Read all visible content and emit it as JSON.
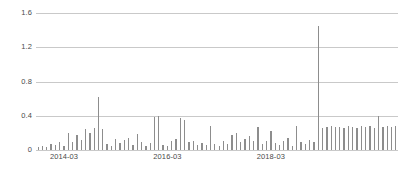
{
  "chart_data": {
    "type": "bar",
    "title": "",
    "subtitle": "",
    "xlabel": "",
    "ylabel": "",
    "ylim": [
      0,
      1.6
    ],
    "grid": true,
    "legend": null,
    "legend_position": "none",
    "bar_color": "#8d8d8d",
    "grid_color": "#c9c9c9",
    "text_color": "#4a4a4a",
    "background_color": "#ffffff",
    "y_ticks": [
      0,
      0.4,
      0.8,
      1.2,
      1.6
    ],
    "y_tick_labels": [
      "0",
      "0.4",
      "0.8",
      "1.2",
      "1.6"
    ],
    "x_tick_labels": [
      "2014-03",
      "2016-03",
      "2018-03"
    ],
    "x_tick_categories": [
      "2014-03",
      "2016-03",
      "2018-03"
    ],
    "categories": [
      "2013-09",
      "2013-10",
      "2013-11",
      "2013-12",
      "2014-01",
      "2014-02",
      "2014-03",
      "2014-04",
      "2014-05",
      "2014-06",
      "2014-07",
      "2014-08",
      "2014-09",
      "2014-10",
      "2014-11",
      "2014-12",
      "2015-01",
      "2015-02",
      "2015-03",
      "2015-04",
      "2015-05",
      "2015-06",
      "2015-07",
      "2015-08",
      "2015-09",
      "2015-10",
      "2015-11",
      "2015-12",
      "2016-01",
      "2016-02",
      "2016-03",
      "2016-04",
      "2016-05",
      "2016-06",
      "2016-07",
      "2016-08",
      "2016-09",
      "2016-10",
      "2016-11",
      "2016-12",
      "2017-01",
      "2017-02",
      "2017-03",
      "2017-04",
      "2017-05",
      "2017-06",
      "2017-07",
      "2017-08",
      "2017-09",
      "2017-10",
      "2017-11",
      "2017-12",
      "2018-01",
      "2018-02",
      "2018-03",
      "2018-04",
      "2018-05",
      "2018-06",
      "2018-07",
      "2018-08",
      "2018-09",
      "2018-10",
      "2018-11",
      "2018-12",
      "2019-01",
      "2019-02",
      "2019-03",
      "2019-04",
      "2019-05",
      "2019-06",
      "2019-07",
      "2019-08",
      "2019-09",
      "2019-10",
      "2019-11",
      "2019-12",
      "2020-01",
      "2020-02",
      "2020-03",
      "2020-04",
      "2020-05",
      "2020-06",
      "2020-07",
      "2020-08"
    ],
    "values": [
      0.03,
      0.05,
      0.04,
      0.07,
      0.06,
      0.09,
      0.05,
      0.2,
      0.09,
      0.17,
      0.12,
      0.24,
      0.2,
      0.26,
      0.62,
      0.24,
      0.07,
      0.05,
      0.13,
      0.08,
      0.12,
      0.14,
      0.06,
      0.19,
      0.09,
      0.05,
      0.08,
      0.38,
      0.4,
      0.06,
      0.05,
      0.1,
      0.13,
      0.37,
      0.35,
      0.09,
      0.11,
      0.06,
      0.08,
      0.06,
      0.28,
      0.07,
      0.05,
      0.1,
      0.07,
      0.18,
      0.2,
      0.09,
      0.13,
      0.16,
      0.11,
      0.27,
      0.07,
      0.1,
      0.22,
      0.08,
      0.06,
      0.1,
      0.14,
      0.05,
      0.28,
      0.09,
      0.07,
      0.12,
      0.09,
      1.45,
      0.26,
      0.27,
      0.28,
      0.27,
      0.27,
      0.26,
      0.28,
      0.27,
      0.26,
      0.28,
      0.27,
      0.28,
      0.26,
      0.4,
      0.27,
      0.28,
      0.27,
      0.28
    ],
    "annotations": [
      {
        "label": "peak",
        "category": "2019-02",
        "value": 1.45
      },
      {
        "label": "secondary-peak",
        "category": "2014-11",
        "value": 0.62
      }
    ]
  }
}
